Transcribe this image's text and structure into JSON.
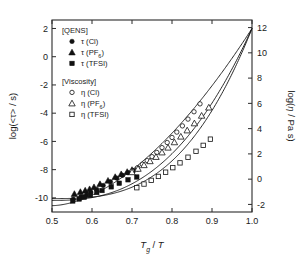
{
  "figure": {
    "kind": "angell-fragility-plot",
    "background": "#ffffff",
    "foreground": "#111111"
  },
  "axes": {
    "x": {
      "label_parts": {
        "t": "T",
        "sub": "g",
        "slash": " / ",
        "t2": "T"
      },
      "label_plain": "Tg / T",
      "min": 0.5,
      "max": 1.0,
      "ticks": [
        0.5,
        0.6,
        0.7,
        0.8,
        0.9,
        1.0
      ],
      "tick_labels": [
        "0.5",
        "0.6",
        "0.7",
        "0.8",
        "0.9",
        "1.0"
      ]
    },
    "y_left": {
      "label_plain": "log(<t> / s)",
      "label_prefix": "log(<",
      "label_symbol": "τ",
      "label_suffix": "> / s)",
      "min": -11,
      "max": 2.6,
      "ticks": [
        2,
        0,
        -2,
        -4,
        -6,
        -8,
        -10
      ],
      "tick_labels": [
        "2",
        "0",
        "-2",
        "-4",
        "-6",
        "-8",
        "-10"
      ]
    },
    "y_right": {
      "label_plain": "log(n / Pa s)",
      "label_prefix": "log(",
      "label_symbol": "η",
      "label_suffix": " / Pa s)",
      "min": -2.6,
      "max": 12.6,
      "ticks": [
        12,
        10,
        8,
        6,
        4,
        2,
        0,
        -2
      ],
      "tick_labels": [
        "12",
        "10",
        "8",
        "6",
        "4",
        "2",
        "0",
        "-2"
      ]
    }
  },
  "legend": {
    "groups": [
      {
        "header": "[QENS]",
        "entries": [
          {
            "marker": "filled-circle",
            "symbol": "τ",
            "sample": "(Cl)",
            "label": "τ (Cl)"
          },
          {
            "marker": "filled-triangle",
            "symbol": "τ",
            "sample": "(PF6)",
            "label": "τ (PF6)",
            "sub": "6",
            "base": "(PF"
          },
          {
            "marker": "filled-square",
            "symbol": "τ",
            "sample": "(TFSI)",
            "label": "τ (TFSI)"
          }
        ]
      },
      {
        "header": "[Viscosity]",
        "entries": [
          {
            "marker": "open-circle",
            "symbol": "η",
            "sample": "(Cl)",
            "label": "η (Cl)"
          },
          {
            "marker": "open-triangle",
            "symbol": "η",
            "sample": "(PF6)",
            "label": "η (PF6)",
            "sub": "6",
            "base": "(PF"
          },
          {
            "marker": "open-square",
            "symbol": "η",
            "sample": "(TFSI)",
            "label": "η (TFSI)"
          }
        ]
      }
    ]
  },
  "chart_data": {
    "type": "scatter",
    "title": "",
    "xlabel": "Tg / T",
    "ylabel": "log(<τ> / s)",
    "ylabel_right": "log(η / Pa s)",
    "xlim": [
      0.5,
      1.0
    ],
    "ylim": [
      -11,
      2.6
    ],
    "ylim_right": [
      -2.6,
      12.6
    ],
    "grid": false,
    "legend_position": "upper-left",
    "axis_map_note": "left log(tau/s) = right log(eta/Pa s) - 10",
    "series": [
      {
        "name": "τ (Cl)",
        "group": "QENS",
        "marker": "filled-circle",
        "x": [
          0.553,
          0.572,
          0.586,
          0.597,
          0.612,
          0.628,
          0.646,
          0.662,
          0.676,
          0.69,
          0.703,
          0.714
        ],
        "y": [
          -10.1,
          -9.92,
          -9.8,
          -9.62,
          -9.4,
          -9.12,
          -8.86,
          -8.6,
          -8.4,
          -8.22,
          -8.06,
          -7.95
        ]
      },
      {
        "name": "τ (PF6)",
        "group": "QENS",
        "marker": "filled-triangle",
        "x": [
          0.556,
          0.571,
          0.583,
          0.594,
          0.605,
          0.62,
          0.64,
          0.658,
          0.673,
          0.688,
          0.7
        ],
        "y": [
          -9.72,
          -9.58,
          -9.48,
          -9.38,
          -9.24,
          -9.02,
          -8.78,
          -8.52,
          -8.32,
          -8.16,
          -8.02
        ]
      },
      {
        "name": "τ (TFSI)",
        "group": "QENS",
        "marker": "filled-square",
        "x": [
          0.552,
          0.568,
          0.581,
          0.596,
          0.612,
          0.625,
          0.648,
          0.668,
          0.69,
          0.712
        ],
        "y": [
          -10.22,
          -10.08,
          -9.95,
          -9.8,
          -9.62,
          -9.48,
          -9.22,
          -8.96,
          -8.72,
          -8.52
        ]
      },
      {
        "name": "η (Cl)",
        "group": "Viscosity",
        "marker": "open-circle",
        "x": [
          0.7,
          0.714,
          0.726,
          0.738,
          0.75,
          0.762,
          0.775,
          0.788,
          0.8,
          0.812,
          0.826,
          0.84,
          0.855,
          0.87
        ],
        "y": [
          -8.1,
          -7.86,
          -7.62,
          -7.36,
          -7.08,
          -6.78,
          -6.44,
          -6.08,
          -5.72,
          -5.34,
          -4.9,
          -4.42,
          -3.9,
          -3.34
        ]
      },
      {
        "name": "η (PF6)",
        "group": "Viscosity",
        "marker": "open-triangle",
        "x": [
          0.7,
          0.715,
          0.73,
          0.745,
          0.76,
          0.775,
          0.79,
          0.806,
          0.822,
          0.838,
          0.856,
          0.874,
          0.892
        ],
        "y": [
          -8.18,
          -7.94,
          -7.68,
          -7.4,
          -7.1,
          -6.78,
          -6.44,
          -6.06,
          -5.66,
          -5.22,
          -4.72,
          -4.18,
          -3.6
        ]
      },
      {
        "name": "η (TFSI)",
        "group": "Viscosity",
        "marker": "open-square",
        "x": [
          0.712,
          0.73,
          0.748,
          0.766,
          0.784,
          0.802,
          0.82,
          0.84,
          0.86,
          0.878,
          0.896
        ],
        "y": [
          -9.28,
          -9.02,
          -8.76,
          -8.48,
          -8.18,
          -7.86,
          -7.52,
          -7.12,
          -6.7,
          -6.28,
          -5.84
        ]
      }
    ],
    "fit_curves": [
      {
        "name": "VFT fit (Cl)",
        "anchor": [
          1.0,
          2.0
        ],
        "start": [
          0.5,
          -10.05
        ],
        "curvature": 2.95
      },
      {
        "name": "VFT fit (PF6)",
        "anchor": [
          1.0,
          2.0
        ],
        "start": [
          0.5,
          -10.18
        ],
        "curvature": 2.55
      },
      {
        "name": "VFT fit (TFSI)",
        "anchor": [
          1.0,
          2.0
        ],
        "start": [
          0.5,
          -10.55
        ],
        "curvature": 1.75
      }
    ]
  }
}
